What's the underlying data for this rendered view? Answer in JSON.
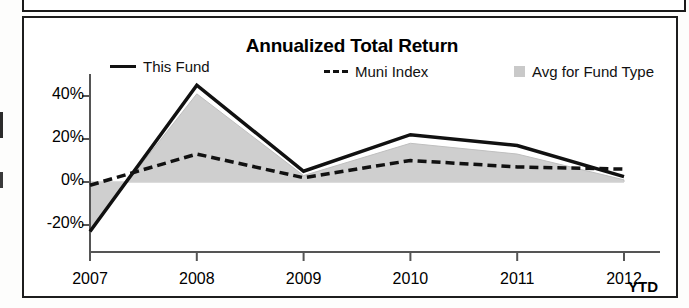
{
  "document": {
    "top_fragment_present": true
  },
  "chart_panel": {
    "title": "Annualized Total Return",
    "legend": [
      {
        "key": "this_fund",
        "label": "This Fund",
        "marker": "solid-line-swatch",
        "color": "#111111"
      },
      {
        "key": "muni_index",
        "label": "Muni Index",
        "marker": "dashed-line-swatch",
        "color": "#111111"
      },
      {
        "key": "avg_fund_type",
        "label": "Avg for Fund Type",
        "marker": "gray-area-swatch",
        "color": "#c9c9c9"
      }
    ],
    "period_suffix": "YTD"
  },
  "chart_data": {
    "type": "line",
    "title": "Annualized Total Return",
    "xlabel": "",
    "ylabel": "",
    "categories": [
      "2007",
      "2008",
      "2009",
      "2010",
      "2011",
      "2012"
    ],
    "x_tick_labels": [
      "2007",
      "2008",
      "2009",
      "2010",
      "2011",
      "2012"
    ],
    "x_axis_note": "YTD",
    "y_tick_labels": [
      "40%",
      "20%",
      "0%",
      "-20%"
    ],
    "y_tick_values": [
      40,
      20,
      0,
      -20
    ],
    "ylim": [
      -30,
      50
    ],
    "grid": false,
    "legend_position": "top",
    "series": [
      {
        "name": "This Fund",
        "style": "solid",
        "color": "#111111",
        "values": [
          -23,
          45,
          5,
          22,
          17,
          2.5
        ]
      },
      {
        "name": "Muni Index",
        "style": "dashed",
        "color": "#111111",
        "values": [
          -1.5,
          13,
          2,
          10,
          7,
          6
        ]
      },
      {
        "name": "Avg for Fund Type",
        "style": "filled-area",
        "color": "#c9c9c9",
        "values": [
          -22,
          41,
          3,
          18,
          13,
          1
        ]
      }
    ]
  }
}
